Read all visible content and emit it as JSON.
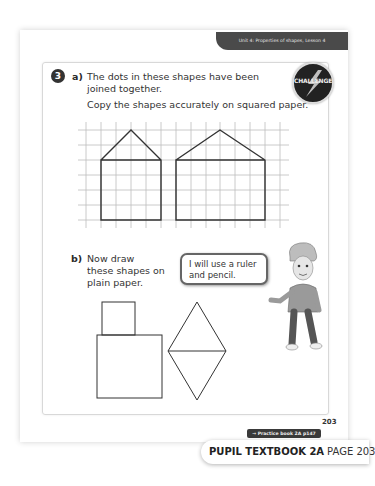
{
  "header": {
    "unit_label": "Unit 4: Properties of shapes, Lesson 4"
  },
  "question": {
    "number": "3",
    "badge": {
      "icon": "challenge-icon",
      "label": "CHALLENGE"
    },
    "part_a": {
      "label": "a)",
      "line1": "The dots in these shapes have been",
      "line2": "joined together.",
      "instruction": "Copy the shapes accurately on squared paper.",
      "grid": {
        "x_lines": [
          86,
          101,
          116,
          131,
          146,
          161,
          176,
          191,
          206,
          220,
          235,
          250,
          265,
          280
        ],
        "y_lines": [
          130,
          145,
          160,
          175,
          190,
          205,
          220
        ],
        "shapes": [
          {
            "name": "house-1",
            "points": "101,160 131,130 161,160 161,220 101,220 101,160 161,160"
          },
          {
            "name": "house-2",
            "points": "176,160 220,130 265,160 265,220 176,220 176,160 265,160"
          }
        ]
      }
    },
    "part_b": {
      "label": "b)",
      "line1": "Now draw",
      "line2": "these shapes on",
      "line3": "plain paper.",
      "speech_line1": "I will use a ruler",
      "speech_line2": "and pencil."
    }
  },
  "footer": {
    "page_number": "203",
    "practice_link": "→ Practice book 2A p147",
    "book_title": "PUPIL TEXTBOOK 2A",
    "book_page": "PAGE 203"
  },
  "colors": {
    "ink": "#333333",
    "grid": "#bdbdbd",
    "header_bg": "#4a4a4a"
  }
}
